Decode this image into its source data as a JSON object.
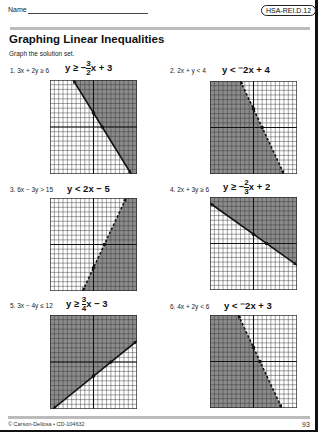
{
  "header": {
    "name_label": "Name",
    "standard_badge": "HSA-REI.D.12",
    "title": "Graphing Linear Inequalities",
    "instructions": "Graph the solution set."
  },
  "problems": [
    {
      "number": "1.",
      "inequality": "3x + 2y ≥ 6",
      "answer_prefix": "y ≥ −",
      "answer_num": "3",
      "answer_den": "2",
      "answer_suffix": "x + 3"
    },
    {
      "number": "2.",
      "inequality": "2x + y < 4",
      "answer_text": "y < ⁻2x + 4"
    },
    {
      "number": "3.",
      "inequality": "6x − 3y > 15",
      "answer_text": "y < 2x − 5"
    },
    {
      "number": "4.",
      "inequality": "2x + 3y ≥ 6",
      "answer_prefix": "y ≥ −",
      "answer_num": "2",
      "answer_den": "3",
      "answer_suffix": "x + 2"
    },
    {
      "number": "5.",
      "inequality": "3x − 4y ≤ 12",
      "answer_prefix": "y ≥ ",
      "answer_num": "3",
      "answer_den": "4",
      "answer_suffix": "x − 3"
    },
    {
      "number": "6.",
      "inequality": "4x + 2y < 6",
      "answer_text": "y < ⁻2x + 3"
    }
  ],
  "chart_data": [
    {
      "type": "line",
      "title": "3x + 2y ≥ 6",
      "slope": -1.5,
      "intercept": 3,
      "boundary": "solid",
      "shade": "above",
      "xlim": [
        -10,
        10
      ],
      "ylim": [
        -10,
        10
      ],
      "grid": true
    },
    {
      "type": "line",
      "title": "2x + y < 4",
      "slope": -2,
      "intercept": 4,
      "boundary": "dashed",
      "shade": "below",
      "xlim": [
        -10,
        10
      ],
      "ylim": [
        -10,
        10
      ],
      "grid": true
    },
    {
      "type": "line",
      "title": "6x − 3y > 15",
      "slope": 2,
      "intercept": -5,
      "boundary": "dashed",
      "shade": "below",
      "xlim": [
        -10,
        10
      ],
      "ylim": [
        -10,
        10
      ],
      "grid": true
    },
    {
      "type": "line",
      "title": "2x + 3y ≥ 6",
      "slope": -0.6667,
      "intercept": 2,
      "boundary": "solid",
      "shade": "above",
      "xlim": [
        -10,
        10
      ],
      "ylim": [
        -10,
        10
      ],
      "grid": true
    },
    {
      "type": "line",
      "title": "3x − 4y ≤ 12",
      "slope": 0.75,
      "intercept": -3,
      "boundary": "solid",
      "shade": "above",
      "xlim": [
        -10,
        10
      ],
      "ylim": [
        -10,
        10
      ],
      "grid": true
    },
    {
      "type": "line",
      "title": "4x + 2y < 6",
      "slope": -2,
      "intercept": 3,
      "boundary": "dashed",
      "shade": "below",
      "xlim": [
        -10,
        10
      ],
      "ylim": [
        -10,
        10
      ],
      "grid": true
    }
  ],
  "footer": {
    "copyright": "© Carson-Dellosa • CD-104632",
    "page_number": "93"
  }
}
